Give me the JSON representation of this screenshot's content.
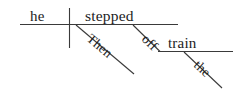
{
  "diagram": {
    "type": "reed-kellogg-sentence-diagram",
    "sentence": "Then he stepped off the train.",
    "colors": {
      "background": "#ffffff",
      "line": "#3a3a3a",
      "text": "#1c1c1c"
    },
    "words": {
      "subject": "he",
      "verb": "stepped",
      "adverb": "Then",
      "preposition": "off",
      "object": "train",
      "article": "the"
    },
    "parts": [
      {
        "label": "he",
        "role": "subject"
      },
      {
        "label": "stepped",
        "role": "verb"
      },
      {
        "label": "Then",
        "role": "adverb-modifier"
      },
      {
        "label": "off",
        "role": "preposition"
      },
      {
        "label": "train",
        "role": "object-of-preposition"
      },
      {
        "label": "the",
        "role": "article-modifier"
      }
    ]
  }
}
